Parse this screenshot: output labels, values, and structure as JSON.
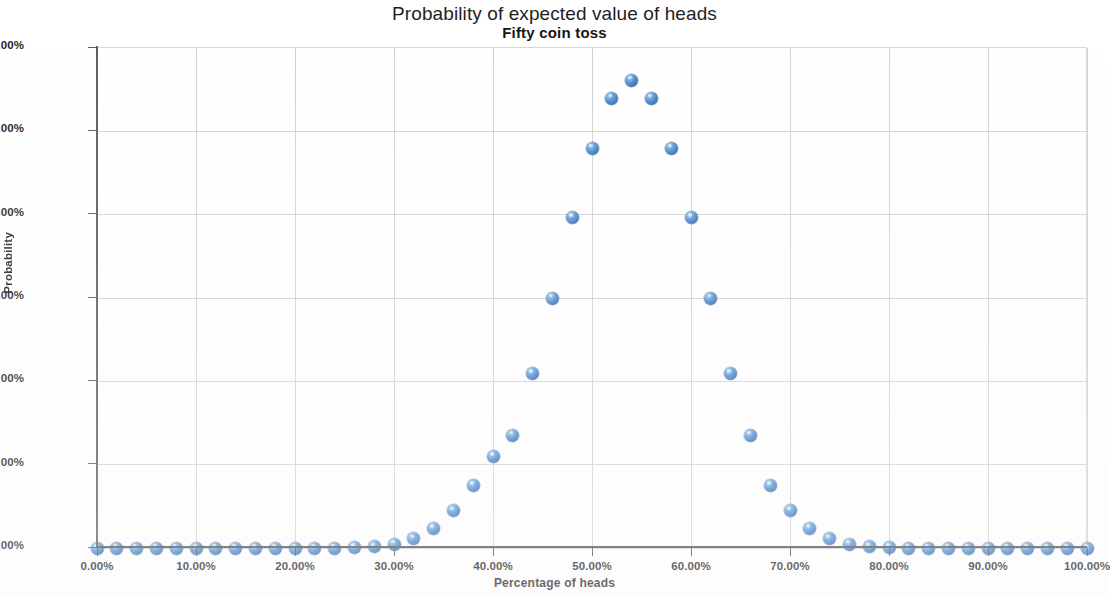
{
  "chart_data": {
    "type": "scatter",
    "title": "Probability of expected value of heads",
    "subtitle": "Fifty coin toss",
    "xlabel": "Percentage of heads",
    "ylabel": "Probability",
    "xlim": [
      0,
      100
    ],
    "ylim": [
      0,
      12
    ],
    "grid": true,
    "legend": "none",
    "x_tick_labels": [
      "0.00%",
      "10.00%",
      "20.00%",
      "30.00%",
      "40.00%",
      "50.00%",
      "60.00%",
      "70.00%",
      "80.00%",
      "90.00%",
      "100.00%"
    ],
    "x_tick_values": [
      0,
      10,
      20,
      30,
      40,
      50,
      60,
      70,
      80,
      90,
      100
    ],
    "y_tick_labels": [
      "0.00%",
      "2.00%",
      "4.00%",
      "6.00%",
      "8.00%",
      "10.00%",
      "12.00%"
    ],
    "y_tick_values": [
      0,
      2,
      4,
      6,
      8,
      10,
      12
    ],
    "marker_color": "#4f8fd0",
    "series": [
      {
        "name": "Probability",
        "x": [
          0,
          2,
          4,
          6,
          8,
          10,
          12,
          14,
          16,
          18,
          20,
          22,
          24,
          26,
          28,
          30,
          32,
          34,
          36,
          38,
          40,
          42,
          44,
          46,
          48,
          50,
          52,
          54,
          56,
          58,
          60,
          62,
          64,
          66,
          68,
          70,
          72,
          74,
          76,
          78,
          80,
          82,
          84,
          86,
          88,
          90,
          92,
          94,
          96,
          98,
          100
        ],
        "values": [
          0.0,
          0.0,
          0.0,
          0.0,
          0.0,
          0.0,
          0.0,
          0.0,
          0.0,
          0.0,
          0.0,
          0.0,
          0.0,
          0.01,
          0.03,
          0.09,
          0.22,
          0.47,
          0.89,
          1.5,
          2.2,
          2.71,
          4.19,
          6.0,
          7.93,
          9.6,
          10.8,
          11.23,
          10.8,
          9.6,
          7.93,
          6.0,
          4.19,
          2.71,
          1.5,
          0.89,
          0.47,
          0.22,
          0.09,
          0.03,
          0.01,
          0.0,
          0.0,
          0.0,
          0.0,
          0.0,
          0.0,
          0.0,
          0.0,
          0.0,
          0.0
        ]
      }
    ],
    "points": [
      {
        "x": 0,
        "y": 0.0
      },
      {
        "x": 2,
        "y": 0.0
      },
      {
        "x": 4,
        "y": 0.0
      },
      {
        "x": 6,
        "y": 0.0
      },
      {
        "x": 8,
        "y": 0.0
      },
      {
        "x": 10,
        "y": 0.0
      },
      {
        "x": 12,
        "y": 0.0
      },
      {
        "x": 14,
        "y": 0.0
      },
      {
        "x": 16,
        "y": 0.0
      },
      {
        "x": 18,
        "y": 0.0
      },
      {
        "x": 20,
        "y": 0.0
      },
      {
        "x": 22,
        "y": 0.0
      },
      {
        "x": 24,
        "y": 0.0
      },
      {
        "x": 26,
        "y": 0.01
      },
      {
        "x": 28,
        "y": 0.03
      },
      {
        "x": 30,
        "y": 0.09
      },
      {
        "x": 32,
        "y": 0.22
      },
      {
        "x": 34,
        "y": 0.47
      },
      {
        "x": 36,
        "y": 0.89
      },
      {
        "x": 38,
        "y": 1.6
      },
      {
        "x": 40,
        "y": 1.6
      },
      {
        "x": 42,
        "y": 2.71
      },
      {
        "x": 44,
        "y": 4.19
      },
      {
        "x": 46,
        "y": 6.0
      },
      {
        "x": 48,
        "y": 7.93
      },
      {
        "x": 50,
        "y": 9.6
      },
      {
        "x": 52,
        "y": 10.8
      },
      {
        "x": 54,
        "y": 11.23
      },
      {
        "x": 56,
        "y": 10.8
      },
      {
        "x": 58,
        "y": 9.6
      },
      {
        "x": 60,
        "y": 7.93
      },
      {
        "x": 62,
        "y": 6.0
      },
      {
        "x": 64,
        "y": 4.19
      },
      {
        "x": 66,
        "y": 2.71
      },
      {
        "x": 68,
        "y": 1.6
      },
      {
        "x": 70,
        "y": 0.89
      },
      {
        "x": 72,
        "y": 0.47
      },
      {
        "x": 74,
        "y": 0.22
      },
      {
        "x": 76,
        "y": 0.09
      },
      {
        "x": 78,
        "y": 0.03
      },
      {
        "x": 80,
        "y": 0.01
      },
      {
        "x": 82,
        "y": 0.0
      },
      {
        "x": 84,
        "y": 0.0
      },
      {
        "x": 86,
        "y": 0.0
      },
      {
        "x": 88,
        "y": 0.0
      },
      {
        "x": 90,
        "y": 0.0
      },
      {
        "x": 92,
        "y": 0.0
      },
      {
        "x": 94,
        "y": 0.0
      },
      {
        "x": 96,
        "y": 0.0
      },
      {
        "x": 98,
        "y": 0.0
      },
      {
        "x": 100,
        "y": 0.0
      }
    ]
  }
}
